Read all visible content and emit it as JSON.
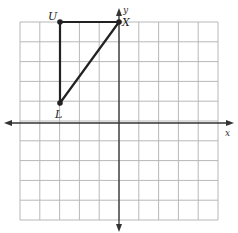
{
  "diagram": {
    "type": "coordinate-grid",
    "grid": {
      "columns": 10,
      "rows": 10,
      "x_range": [
        -5,
        5
      ],
      "y_range": [
        -5,
        5
      ]
    },
    "axes": {
      "x_label": "x",
      "y_label": "y"
    },
    "triangle": {
      "vertices": [
        {
          "name": "U",
          "x": -3,
          "y": 5
        },
        {
          "name": "X",
          "x": 0,
          "y": 5
        },
        {
          "name": "L",
          "x": -3,
          "y": 1
        }
      ]
    }
  },
  "labels": {
    "U": "U",
    "X": "X",
    "L": "L",
    "x_axis": "x",
    "y_axis": "y"
  }
}
